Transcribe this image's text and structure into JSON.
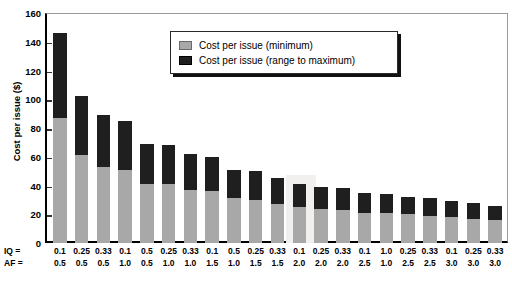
{
  "chart_data": {
    "type": "bar",
    "subtype": "stacked-bar",
    "title": "",
    "xlabel": "",
    "ylabel": "Cost per issue ($)",
    "ylim": [
      0,
      160
    ],
    "ytick_step": 20,
    "yticks": [
      0,
      20,
      40,
      60,
      80,
      100,
      120,
      140,
      160
    ],
    "grid": false,
    "legend_position": "top-center",
    "colors": {
      "minimum": "#a8a8a8",
      "range_to_maximum": "#1f1f1f",
      "axis": "#000000",
      "background": "#ffffff"
    },
    "legend": [
      "Cost per issue (minimum)",
      "Cost per issue (range to maximum)"
    ],
    "series": [
      {
        "name": "Cost per issue (minimum)",
        "values": [
          87,
          61,
          53,
          51,
          41,
          41,
          37,
          36,
          31,
          30,
          27,
          25,
          24,
          23,
          21,
          21,
          20,
          19,
          18,
          17,
          16
        ]
      },
      {
        "name": "Cost per issue (range to maximum)",
        "values": [
          59,
          41,
          36,
          34,
          28,
          27,
          25,
          24,
          20,
          20,
          18,
          16,
          15,
          15,
          14,
          13,
          12,
          12,
          11,
          11,
          10
        ]
      }
    ],
    "totals": [
      146,
      102,
      89,
      85,
      69,
      68,
      62,
      60,
      51,
      50,
      45,
      41,
      39,
      38,
      35,
      34,
      32,
      31,
      29,
      28,
      26
    ],
    "x_axis_rows": [
      {
        "key": "IQ =",
        "values": [
          "0.1",
          "0.25",
          "0.33",
          "0.1",
          "0.5",
          "0.25",
          "0.33",
          "0.1",
          "0.5",
          "0.25",
          "0.33",
          "0.1",
          "0.25",
          "0.33",
          "0.1",
          "1.0",
          "0.25",
          "0.33",
          "0.1",
          "0.25",
          "0.33"
        ]
      },
      {
        "key": "AF =",
        "values": [
          "0.5",
          "0.5",
          "0.5",
          "1.0",
          "0.5",
          "1.0",
          "1.0",
          "1.5",
          "1.0",
          "1.5",
          "1.5",
          "2.0",
          "2.0",
          "2.0",
          "2.5",
          "1.0",
          "2.5",
          "2.5",
          "3.0",
          "3.0",
          "3.0"
        ]
      }
    ],
    "categories": [
      "IQ=0.1 AF=0.5",
      "IQ=0.25 AF=0.5",
      "IQ=0.33 AF=0.5",
      "IQ=0.1 AF=1.0",
      "IQ=0.5 AF=0.5",
      "IQ=0.25 AF=1.0",
      "IQ=0.33 AF=1.0",
      "IQ=0.1 AF=1.5",
      "IQ=0.5 AF=1.0",
      "IQ=0.25 AF=1.5",
      "IQ=0.33 AF=1.5",
      "IQ=0.1 AF=2.0",
      "IQ=0.25 AF=2.0",
      "IQ=0.33 AF=2.0",
      "IQ=0.1 AF=2.5",
      "IQ=1.0 AF=1.0",
      "IQ=0.25 AF=2.5",
      "IQ=0.33 AF=2.5",
      "IQ=0.1 AF=3.0",
      "IQ=0.25 AF=3.0",
      "IQ=0.33 AF=3.0"
    ]
  }
}
